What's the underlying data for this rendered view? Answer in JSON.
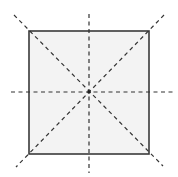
{
  "diagram": {
    "colors": {
      "background": "#ffffff",
      "square_fill": "#f3f3f3",
      "square_stroke": "#3a3a3a",
      "symmetry_line": "#333333",
      "center_dot": "#222222"
    },
    "square": {
      "x": 29,
      "y": 31,
      "width": 120,
      "height": 123
    },
    "center": {
      "x": 89,
      "y": 92
    },
    "symmetry_lines": [
      {
        "name": "vertical",
        "x1": 89,
        "y1": 14,
        "x2": 89,
        "y2": 173
      },
      {
        "name": "horizontal",
        "x1": 11,
        "y1": 92,
        "x2": 173,
        "y2": 92
      },
      {
        "name": "diagonal-tl-br",
        "x1": 14,
        "y1": 15,
        "x2": 163,
        "y2": 166
      },
      {
        "name": "diagonal-tr-bl",
        "x1": 164,
        "y1": 15,
        "x2": 16,
        "y2": 167
      }
    ]
  }
}
